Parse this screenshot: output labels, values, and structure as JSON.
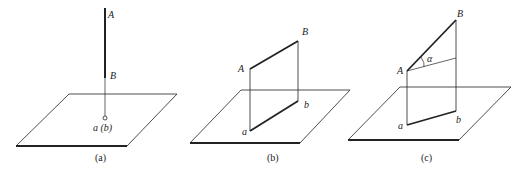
{
  "figure": {
    "panels": [
      {
        "id": "a",
        "caption": "(a)",
        "labels": {
          "A": "A",
          "B": "B",
          "ab": "a (b)"
        }
      },
      {
        "id": "b",
        "caption": "(b)",
        "labels": {
          "A": "A",
          "B": "B",
          "a": "a",
          "b": "b"
        }
      },
      {
        "id": "c",
        "caption": "(c)",
        "labels": {
          "A": "A",
          "B": "B",
          "a": "a",
          "b": "b",
          "alpha": "α"
        }
      }
    ]
  }
}
